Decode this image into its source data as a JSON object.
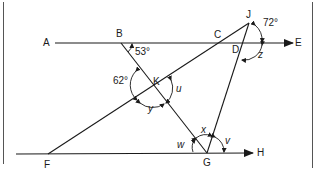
{
  "diagram": {
    "colors": {
      "line": "#1a1a1a",
      "background": "#ffffff",
      "border": "#555555"
    },
    "points": {
      "A": {
        "label": "A"
      },
      "B": {
        "label": "B"
      },
      "C": {
        "label": "C"
      },
      "D": {
        "label": "D"
      },
      "E": {
        "label": "E"
      },
      "F": {
        "label": "F"
      },
      "G": {
        "label": "G"
      },
      "H": {
        "label": "H"
      },
      "J": {
        "label": "J"
      },
      "K": {
        "label": "K"
      }
    },
    "lines": [
      {
        "name": "AE",
        "from": "A",
        "to": "E",
        "arrow": true
      },
      {
        "name": "FH",
        "from": "F",
        "to": "H",
        "arrow": true
      },
      {
        "name": "BG",
        "from": "B",
        "to": "G"
      },
      {
        "name": "FJ",
        "from": "F",
        "to": "J"
      },
      {
        "name": "JG",
        "from": "J",
        "to": "G"
      }
    ],
    "angles": {
      "angle_B": "53°",
      "angle_K_left": "62°",
      "angle_J": "72°",
      "u": "u",
      "y": "y",
      "z": "z",
      "x": "x",
      "v": "v",
      "w": "w"
    }
  }
}
